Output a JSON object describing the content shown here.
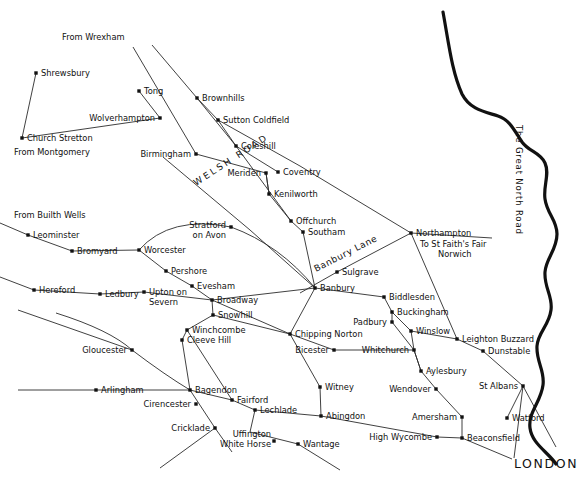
{
  "map": {
    "title": "Historical Drove Roads and Market Towns Map",
    "background_color": "#ffffff",
    "ink_color": "#111111",
    "width": 578,
    "height": 478
  },
  "named_roads": [
    {
      "name": "WELSH ROAD",
      "style": "letterspaced-caps",
      "rotation": -33,
      "x": 196,
      "y": 186
    },
    {
      "name": "Banbury Lane",
      "style": "letterspaced",
      "rotation": -27,
      "x": 316,
      "y": 272
    },
    {
      "name": "The Great North Road",
      "style": "vertical",
      "rotation": 90,
      "x": 516,
      "y": 135
    }
  ],
  "terminus_labels": [
    {
      "text": "From Wrexham",
      "x": 62,
      "y": 40
    },
    {
      "text": "From Montgomery",
      "x": 14,
      "y": 155
    },
    {
      "text": "From Builth Wells",
      "x": 14,
      "y": 218
    },
    {
      "text": "LONDON",
      "x": 514,
      "y": 468,
      "emphasis": "large-caps"
    }
  ],
  "annotations": [
    {
      "text": "To St Faith's Fair",
      "x": 420,
      "y": 247
    },
    {
      "text": "Norwich",
      "x": 438,
      "y": 257
    }
  ],
  "places": [
    {
      "name": "Shrewsbury",
      "x": 36,
      "y": 73,
      "label_dx": 5,
      "label_dy": 3,
      "anchor": "start"
    },
    {
      "name": "Church Stretton",
      "x": 22,
      "y": 138,
      "label_dx": 5,
      "label_dy": 3,
      "anchor": "start"
    },
    {
      "name": "Tong",
      "x": 139,
      "y": 91,
      "label_dx": 5,
      "label_dy": 3,
      "anchor": "start"
    },
    {
      "name": "Wolverhampton",
      "x": 160,
      "y": 118,
      "label_dx": -5,
      "label_dy": 0,
      "anchor": "end"
    },
    {
      "name": "Brownhills",
      "x": 197,
      "y": 98,
      "label_dx": 5,
      "label_dy": 3,
      "anchor": "start"
    },
    {
      "name": "Sutton Coldfield",
      "x": 218,
      "y": 120,
      "label_dx": 5,
      "label_dy": 3,
      "anchor": "start"
    },
    {
      "name": "Coleshill",
      "x": 236,
      "y": 146,
      "label_dx": 5,
      "label_dy": 3,
      "anchor": "start"
    },
    {
      "name": "Birmingham",
      "x": 196,
      "y": 154,
      "label_dx": -5,
      "label_dy": 0,
      "anchor": "end"
    },
    {
      "name": "Meriden",
      "x": 266,
      "y": 173,
      "label_dx": -5,
      "label_dy": 0,
      "anchor": "end"
    },
    {
      "name": "Coventry",
      "x": 278,
      "y": 172,
      "label_dx": 5,
      "label_dy": 3,
      "anchor": "start"
    },
    {
      "name": "Kenilworth",
      "x": 269,
      "y": 194,
      "label_dx": 5,
      "label_dy": 3,
      "anchor": "start"
    },
    {
      "name": "Offchurch",
      "x": 291,
      "y": 221,
      "label_dx": 5,
      "label_dy": 3,
      "anchor": "start"
    },
    {
      "name": "Southam",
      "x": 303,
      "y": 232,
      "label_dx": 5,
      "label_dy": 3,
      "anchor": "start"
    },
    {
      "name": "Northampton",
      "x": 411,
      "y": 233,
      "label_dx": 5,
      "label_dy": 3,
      "anchor": "start"
    },
    {
      "name": "Sulgrave",
      "x": 337,
      "y": 272,
      "label_dx": 5,
      "label_dy": 3,
      "anchor": "start"
    },
    {
      "name": "Banbury",
      "x": 315,
      "y": 288,
      "label_dx": 5,
      "label_dy": 3,
      "anchor": "start"
    },
    {
      "name": "Biddlesden",
      "x": 384,
      "y": 297,
      "label_dx": 5,
      "label_dy": 3,
      "anchor": "start"
    },
    {
      "name": "Buckingham",
      "x": 392,
      "y": 312,
      "label_dx": 5,
      "label_dy": 3,
      "anchor": "start"
    },
    {
      "name": "Padbury",
      "x": 392,
      "y": 322,
      "label_dx": -5,
      "label_dy": 0,
      "anchor": "end"
    },
    {
      "name": "Winslow",
      "x": 411,
      "y": 331,
      "label_dx": 5,
      "label_dy": 3,
      "anchor": "start"
    },
    {
      "name": "Leighton Buzzard",
      "x": 457,
      "y": 339,
      "label_dx": 5,
      "label_dy": 3,
      "anchor": "start"
    },
    {
      "name": "Dunstable",
      "x": 483,
      "y": 351,
      "label_dx": 5,
      "label_dy": 3,
      "anchor": "start"
    },
    {
      "name": "Whitchurch",
      "x": 414,
      "y": 350,
      "label_dx": -5,
      "label_dy": 0,
      "anchor": "end"
    },
    {
      "name": "Aylesbury",
      "x": 421,
      "y": 371,
      "label_dx": 5,
      "label_dy": 3,
      "anchor": "start"
    },
    {
      "name": "Wendover",
      "x": 436,
      "y": 389,
      "label_dx": -5,
      "label_dy": 0,
      "anchor": "end"
    },
    {
      "name": "St Albans",
      "x": 523,
      "y": 386,
      "label_dx": -5,
      "label_dy": 0,
      "anchor": "end"
    },
    {
      "name": "Watford",
      "x": 507,
      "y": 418,
      "label_dx": 5,
      "label_dy": 3,
      "anchor": "start"
    },
    {
      "name": "Amersham",
      "x": 462,
      "y": 417,
      "label_dx": -5,
      "label_dy": 0,
      "anchor": "end"
    },
    {
      "name": "Beaconsfield",
      "x": 462,
      "y": 438,
      "label_dx": 5,
      "label_dy": 3,
      "anchor": "start"
    },
    {
      "name": "High Wycombe",
      "x": 437,
      "y": 437,
      "label_dx": -5,
      "label_dy": 0,
      "anchor": "end"
    },
    {
      "name": "Chipping Norton",
      "x": 290,
      "y": 334,
      "label_dx": 5,
      "label_dy": 3,
      "anchor": "start"
    },
    {
      "name": "Bicester",
      "x": 334,
      "y": 350,
      "label_dx": -5,
      "label_dy": 0,
      "anchor": "end"
    },
    {
      "name": "Witney",
      "x": 320,
      "y": 387,
      "label_dx": 5,
      "label_dy": 3,
      "anchor": "start"
    },
    {
      "name": "Abingdon",
      "x": 321,
      "y": 416,
      "label_dx": 5,
      "label_dy": 3,
      "anchor": "start"
    },
    {
      "name": "Wantage",
      "x": 298,
      "y": 444,
      "label_dx": 5,
      "label_dy": 3,
      "anchor": "start"
    },
    {
      "name": "Leominster",
      "x": 28,
      "y": 235,
      "label_dx": 5,
      "label_dy": 3,
      "anchor": "start"
    },
    {
      "name": "Bromyard",
      "x": 72,
      "y": 251,
      "label_dx": 5,
      "label_dy": 3,
      "anchor": "start"
    },
    {
      "name": "Worcester",
      "x": 139,
      "y": 250,
      "label_dx": 5,
      "label_dy": 3,
      "anchor": "start"
    },
    {
      "name": "Stratford on Avon",
      "x": 231,
      "y": 227,
      "label_dx": -5,
      "label_dy": 0,
      "anchor": "end"
    },
    {
      "name": "Pershore",
      "x": 166,
      "y": 271,
      "label_dx": 5,
      "label_dy": 3,
      "anchor": "start"
    },
    {
      "name": "Evesham",
      "x": 192,
      "y": 286,
      "label_dx": 5,
      "label_dy": 3,
      "anchor": "start"
    },
    {
      "name": "Hereford",
      "x": 34,
      "y": 290,
      "label_dx": 5,
      "label_dy": 3,
      "anchor": "start"
    },
    {
      "name": "Ledbury",
      "x": 100,
      "y": 294,
      "label_dx": 5,
      "label_dy": 3,
      "anchor": "start"
    },
    {
      "name": "Upton on Severn",
      "x": 144,
      "y": 292,
      "label_dx": 5,
      "label_dy": 3,
      "anchor": "start"
    },
    {
      "name": "Broadway",
      "x": 212,
      "y": 300,
      "label_dx": 5,
      "label_dy": 3,
      "anchor": "start"
    },
    {
      "name": "Snowhill",
      "x": 213,
      "y": 315,
      "label_dx": 5,
      "label_dy": 3,
      "anchor": "start"
    },
    {
      "name": "Winchcombe",
      "x": 187,
      "y": 330,
      "label_dx": 5,
      "label_dy": 3,
      "anchor": "start"
    },
    {
      "name": "Cleeve Hill",
      "x": 182,
      "y": 340,
      "label_dx": 5,
      "label_dy": 3,
      "anchor": "start"
    },
    {
      "name": "Gloucester",
      "x": 132,
      "y": 350,
      "label_dx": -5,
      "label_dy": 0,
      "anchor": "end"
    },
    {
      "name": "Arlingham",
      "x": 96,
      "y": 390,
      "label_dx": 5,
      "label_dy": 3,
      "anchor": "start"
    },
    {
      "name": "Bagendon",
      "x": 190,
      "y": 390,
      "label_dx": 5,
      "label_dy": 3,
      "anchor": "start"
    },
    {
      "name": "Cirencester",
      "x": 196,
      "y": 404,
      "label_dx": -5,
      "label_dy": 0,
      "anchor": "end"
    },
    {
      "name": "Cricklade",
      "x": 215,
      "y": 428,
      "label_dx": -5,
      "label_dy": 0,
      "anchor": "end"
    },
    {
      "name": "Fairford",
      "x": 232,
      "y": 400,
      "label_dx": 5,
      "label_dy": 3,
      "anchor": "start"
    },
    {
      "name": "Lechlade",
      "x": 255,
      "y": 410,
      "label_dx": 5,
      "label_dy": 3,
      "anchor": "start"
    },
    {
      "name": "Uffington White Horse",
      "x": 274,
      "y": 441,
      "label_dx": -5,
      "label_dy": 0,
      "anchor": "end"
    }
  ],
  "multiline_labels": [
    {
      "name": "Stratford on Avon",
      "lines": [
        "Stratford",
        "on Avon"
      ],
      "x": 226,
      "y": 228,
      "anchor": "end"
    },
    {
      "name": "Upton on Severn",
      "lines": [
        "Upton on",
        "Severn"
      ],
      "x": 149,
      "y": 295,
      "anchor": "start"
    },
    {
      "name": "Uffington White Horse",
      "lines": [
        "Uffington",
        "White Horse"
      ],
      "x": 271,
      "y": 437,
      "anchor": "end"
    }
  ]
}
